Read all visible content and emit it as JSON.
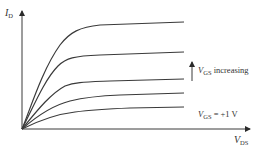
{
  "diagram": {
    "type": "MOSFET drain characteristic curves",
    "y_axis": {
      "symbol": "I",
      "subscript": "D"
    },
    "x_axis": {
      "symbol": "V",
      "subscript": "DS"
    },
    "annotations": {
      "increasing": {
        "symbol": "V",
        "subscript": "GS",
        "text": " increasing"
      },
      "lowest": {
        "symbol": "V",
        "subscript": "GS",
        "text": " = +1 V"
      }
    },
    "curves": [
      {
        "name": "curve-5",
        "end_y": 22
      },
      {
        "name": "curve-4",
        "end_y": 52
      },
      {
        "name": "curve-3",
        "end_y": 79
      },
      {
        "name": "curve-2",
        "end_y": 91
      },
      {
        "name": "curve-1",
        "end_y": 105,
        "label": "V_GS = +1 V"
      }
    ],
    "colors": {
      "line": "#3a3a3a",
      "background": "#ffffff"
    }
  }
}
